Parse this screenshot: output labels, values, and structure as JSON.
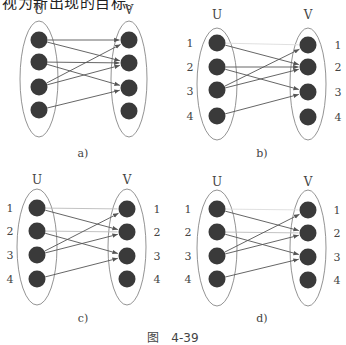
{
  "top_text": "视为新出现的目标。",
  "caption": {
    "prefix": "图",
    "number": "4-39"
  },
  "colors": {
    "node": "#3a3a3a",
    "ellipse": "#777777",
    "edge": "#555555",
    "edge_light": "#bbbbbb",
    "edge_faint": "#dddddd",
    "label": "#444444"
  },
  "panels": [
    {
      "id": "a",
      "sublabel": "a)",
      "sublabel_pos": [
        83,
        157
      ],
      "set_labels": {
        "u": "U",
        "v": "V",
        "u_pos": [
          39,
          14
        ],
        "v_pos": [
          129,
          14
        ]
      },
      "u_ellipse": [
        39,
        79,
        19,
        58
      ],
      "v_ellipse": [
        129,
        79,
        18,
        58
      ],
      "u_nodes": [
        [
          39,
          40
        ],
        [
          39,
          62
        ],
        [
          39,
          87
        ],
        [
          39,
          110
        ]
      ],
      "v_nodes": [
        [
          129,
          40
        ],
        [
          129,
          63
        ],
        [
          129,
          88
        ],
        [
          129,
          111
        ]
      ],
      "row_labels_left": [],
      "row_labels_right": [],
      "edges": [
        {
          "from": 1,
          "to": 1,
          "style": "normal"
        },
        {
          "from": 1,
          "to": 2,
          "style": "normal"
        },
        {
          "from": 2,
          "to": 2,
          "style": "normal"
        },
        {
          "from": 2,
          "to": 3,
          "style": "normal"
        },
        {
          "from": 3,
          "to": 1,
          "style": "normal"
        },
        {
          "from": 3,
          "to": 2,
          "style": "normal"
        },
        {
          "from": 4,
          "to": 3,
          "style": "normal"
        }
      ]
    },
    {
      "id": "b",
      "sublabel": "b)",
      "sublabel_pos": [
        262,
        157
      ],
      "set_labels": {
        "u": "U",
        "v": "V",
        "u_pos": [
          217,
          19
        ],
        "v_pos": [
          308,
          19
        ]
      },
      "u_ellipse": [
        217,
        84,
        20,
        56
      ],
      "v_ellipse": [
        308,
        84,
        18,
        56
      ],
      "u_nodes": [
        [
          217,
          43
        ],
        [
          217,
          67
        ],
        [
          217,
          90
        ],
        [
          217,
          116
        ]
      ],
      "v_nodes": [
        [
          308,
          45
        ],
        [
          308,
          67
        ],
        [
          308,
          92
        ],
        [
          308,
          117
        ]
      ],
      "row_labels_left": [
        {
          "text": "1",
          "pos": [
            190,
            47
          ]
        },
        {
          "text": "2",
          "pos": [
            190,
            71
          ]
        },
        {
          "text": "3",
          "pos": [
            190,
            95
          ]
        },
        {
          "text": "4",
          "pos": [
            190,
            120
          ]
        }
      ],
      "row_labels_right": [
        {
          "text": "1",
          "pos": [
            338,
            49
          ]
        },
        {
          "text": "2",
          "pos": [
            338,
            71
          ]
        },
        {
          "text": "3",
          "pos": [
            338,
            96
          ]
        },
        {
          "text": "4",
          "pos": [
            338,
            121
          ]
        }
      ],
      "edges": [
        {
          "from": 1,
          "to": 1,
          "style": "faint"
        },
        {
          "from": 1,
          "to": 2,
          "style": "normal"
        },
        {
          "from": 2,
          "to": 2,
          "style": "normal"
        },
        {
          "from": 2,
          "to": 3,
          "style": "normal"
        },
        {
          "from": 3,
          "to": 1,
          "style": "normal"
        },
        {
          "from": 3,
          "to": 2,
          "style": "normal"
        },
        {
          "from": 4,
          "to": 3,
          "style": "normal"
        }
      ]
    },
    {
      "id": "c",
      "sublabel": "c)",
      "sublabel_pos": [
        83,
        322
      ],
      "set_labels": {
        "u": "U",
        "v": "V",
        "u_pos": [
          37,
          184
        ],
        "v_pos": [
          127,
          184
        ]
      },
      "u_ellipse": [
        37,
        247,
        20,
        58
      ],
      "v_ellipse": [
        127,
        247,
        19,
        58
      ],
      "u_nodes": [
        [
          37,
          208
        ],
        [
          37,
          231
        ],
        [
          37,
          255
        ],
        [
          37,
          279
        ]
      ],
      "v_nodes": [
        [
          127,
          209
        ],
        [
          127,
          232
        ],
        [
          127,
          256
        ],
        [
          127,
          279
        ]
      ],
      "row_labels_left": [
        {
          "text": "1",
          "pos": [
            10,
            212
          ]
        },
        {
          "text": "2",
          "pos": [
            10,
            235
          ]
        },
        {
          "text": "3",
          "pos": [
            10,
            259
          ]
        },
        {
          "text": "4",
          "pos": [
            10,
            283
          ]
        }
      ],
      "row_labels_right": [
        {
          "text": "1",
          "pos": [
            157,
            213
          ]
        },
        {
          "text": "2",
          "pos": [
            157,
            236
          ]
        },
        {
          "text": "3",
          "pos": [
            157,
            260
          ]
        },
        {
          "text": "4",
          "pos": [
            157,
            283
          ]
        }
      ],
      "edges": [
        {
          "from": 1,
          "to": 1,
          "style": "light"
        },
        {
          "from": 1,
          "to": 2,
          "style": "normal"
        },
        {
          "from": 2,
          "to": 2,
          "style": "light"
        },
        {
          "from": 2,
          "to": 3,
          "style": "normal"
        },
        {
          "from": 3,
          "to": 1,
          "style": "normal"
        },
        {
          "from": 3,
          "to": 2,
          "style": "normal"
        },
        {
          "from": 4,
          "to": 3,
          "style": "normal"
        }
      ]
    },
    {
      "id": "d",
      "sublabel": "d)",
      "sublabel_pos": [
        262,
        322
      ],
      "set_labels": {
        "u": "U",
        "v": "V",
        "u_pos": [
          217,
          186
        ],
        "v_pos": [
          308,
          186
        ]
      },
      "u_ellipse": [
        217,
        248,
        20,
        58
      ],
      "v_ellipse": [
        308,
        248,
        18,
        58
      ],
      "u_nodes": [
        [
          217,
          209
        ],
        [
          217,
          232
        ],
        [
          217,
          256
        ],
        [
          217,
          279
        ]
      ],
      "v_nodes": [
        [
          308,
          210
        ],
        [
          308,
          233
        ],
        [
          308,
          257
        ],
        [
          308,
          280
        ]
      ],
      "row_labels_left": [
        {
          "text": "1",
          "pos": [
            188,
            213
          ]
        },
        {
          "text": "2",
          "pos": [
            188,
            236
          ]
        },
        {
          "text": "3",
          "pos": [
            188,
            260
          ]
        },
        {
          "text": "4",
          "pos": [
            188,
            283
          ]
        }
      ],
      "row_labels_right": [
        {
          "text": "1",
          "pos": [
            337,
            214
          ]
        },
        {
          "text": "2",
          "pos": [
            337,
            237
          ]
        },
        {
          "text": "3",
          "pos": [
            337,
            261
          ]
        },
        {
          "text": "4",
          "pos": [
            337,
            284
          ]
        }
      ],
      "edges": [
        {
          "from": 1,
          "to": 1,
          "style": "faint"
        },
        {
          "from": 1,
          "to": 2,
          "style": "normal"
        },
        {
          "from": 2,
          "to": 2,
          "style": "light"
        },
        {
          "from": 2,
          "to": 3,
          "style": "normal"
        },
        {
          "from": 3,
          "to": 1,
          "style": "normal"
        },
        {
          "from": 3,
          "to": 2,
          "style": "normal"
        },
        {
          "from": 4,
          "to": 3,
          "style": "normal"
        }
      ]
    }
  ]
}
